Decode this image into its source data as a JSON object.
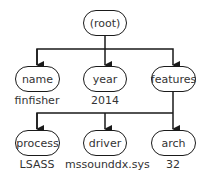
{
  "root": {
    "label": "(root)"
  },
  "children": [
    {
      "label": "name",
      "value": "finfisher"
    },
    {
      "label": "year",
      "value": "2014"
    },
    {
      "label": "features",
      "value": ""
    }
  ],
  "features_children": [
    {
      "label": "process",
      "value": "LSASS"
    },
    {
      "label": "driver",
      "value": "mssounddx.sys"
    },
    {
      "label": "arch",
      "value": "32"
    }
  ],
  "colors": {
    "stroke": "#1a1a1a",
    "background": "#ffffff"
  }
}
